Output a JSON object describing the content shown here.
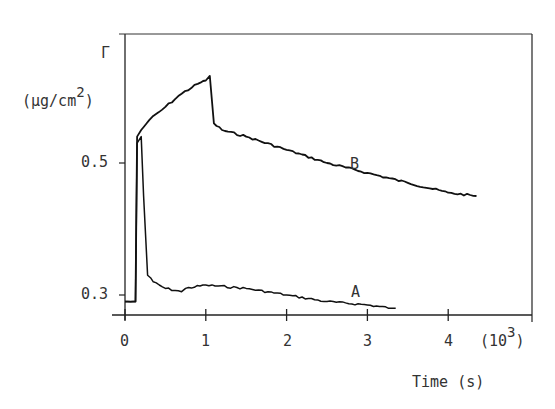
{
  "chart_data": {
    "type": "line",
    "title": "",
    "xlabel": "Time (s)",
    "x_multiplier": "(10^3)",
    "ylabel": "Γ (µg/cm^2)",
    "xlim": [
      0,
      5
    ],
    "ylim": [
      0.27,
      0.7
    ],
    "x_ticks": [
      0,
      1,
      2,
      3,
      4
    ],
    "y_ticks": [
      0.3,
      0.5
    ],
    "grid": false,
    "legend": "inline curve labels",
    "series": [
      {
        "name": "B",
        "x": [
          0.0,
          0.05,
          0.1,
          0.13,
          0.15,
          0.2,
          0.3,
          0.5,
          0.7,
          0.9,
          1.0,
          1.05,
          1.1,
          1.2,
          1.5,
          2.0,
          2.5,
          3.0,
          3.5,
          4.0,
          4.35
        ],
        "y": [
          0.29,
          0.29,
          0.29,
          0.29,
          0.54,
          0.55,
          0.565,
          0.585,
          0.605,
          0.62,
          0.625,
          0.632,
          0.56,
          0.55,
          0.54,
          0.52,
          0.5,
          0.485,
          0.47,
          0.455,
          0.45
        ]
      },
      {
        "name": "A",
        "x": [
          0.0,
          0.1,
          0.13,
          0.15,
          0.2,
          0.23,
          0.28,
          0.35,
          0.5,
          0.7,
          0.75,
          1.0,
          1.5,
          2.0,
          2.5,
          3.0,
          3.3,
          3.35
        ],
        "y": [
          0.29,
          0.29,
          0.29,
          0.53,
          0.54,
          0.45,
          0.33,
          0.32,
          0.31,
          0.305,
          0.31,
          0.315,
          0.31,
          0.3,
          0.29,
          0.285,
          0.28,
          0.28
        ]
      }
    ],
    "annotations": [
      {
        "text": "A",
        "x": 2.85,
        "y": 0.29
      },
      {
        "text": "B",
        "x": 2.85,
        "y": 0.5
      }
    ]
  },
  "labels": {
    "y_symbol": "Γ",
    "y_unit_main": "(µg/cm",
    "y_unit_sup": "2",
    "y_unit_close": ")",
    "x_title": "Time (s)",
    "x_mult_main": "(10",
    "x_mult_sup": "3",
    "x_mult_close": ")",
    "tick_x": [
      "0",
      "1",
      "2",
      "3",
      "4"
    ],
    "tick_y": [
      "0.3",
      "0.5"
    ],
    "curve_a": "A",
    "curve_b": "B"
  }
}
